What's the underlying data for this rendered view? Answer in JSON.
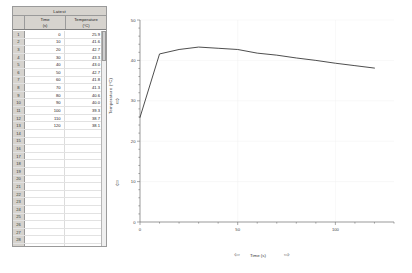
{
  "table": {
    "dataset_label": "Latest",
    "columns": [
      {
        "name": "Time",
        "unit": "(s)"
      },
      {
        "name": "Temperature",
        "unit": "(°C)"
      }
    ],
    "rows": [
      {
        "n": "1",
        "time": "0",
        "temp": "25.9"
      },
      {
        "n": "2",
        "time": "10",
        "temp": "41.6"
      },
      {
        "n": "3",
        "time": "20",
        "temp": "42.7"
      },
      {
        "n": "4",
        "time": "30",
        "temp": "43.3"
      },
      {
        "n": "5",
        "time": "40",
        "temp": "43.0"
      },
      {
        "n": "6",
        "time": "50",
        "temp": "42.7"
      },
      {
        "n": "7",
        "time": "60",
        "temp": "41.8"
      },
      {
        "n": "8",
        "time": "70",
        "temp": "41.3"
      },
      {
        "n": "9",
        "time": "80",
        "temp": "40.6"
      },
      {
        "n": "10",
        "time": "90",
        "temp": "40.0"
      },
      {
        "n": "11",
        "time": "100",
        "temp": "39.3"
      },
      {
        "n": "12",
        "time": "110",
        "temp": "38.7"
      },
      {
        "n": "13",
        "time": "120",
        "temp": "38.1"
      },
      {
        "n": "14",
        "time": "",
        "temp": ""
      },
      {
        "n": "15",
        "time": "",
        "temp": ""
      },
      {
        "n": "16",
        "time": "",
        "temp": ""
      },
      {
        "n": "17",
        "time": "",
        "temp": ""
      },
      {
        "n": "18",
        "time": "",
        "temp": ""
      },
      {
        "n": "19",
        "time": "",
        "temp": ""
      },
      {
        "n": "20",
        "time": "",
        "temp": ""
      },
      {
        "n": "21",
        "time": "",
        "temp": ""
      },
      {
        "n": "22",
        "time": "",
        "temp": ""
      },
      {
        "n": "23",
        "time": "",
        "temp": ""
      },
      {
        "n": "24",
        "time": "",
        "temp": ""
      },
      {
        "n": "25",
        "time": "",
        "temp": ""
      },
      {
        "n": "26",
        "time": "",
        "temp": ""
      },
      {
        "n": "27",
        "time": "",
        "temp": ""
      },
      {
        "n": "28",
        "time": "",
        "temp": ""
      },
      {
        "n": "29",
        "time": "",
        "temp": ""
      }
    ]
  },
  "graph": {
    "ylabel": "Temperature (°C)",
    "xlabel": "Time (s)",
    "y_arrow_up": "⇧",
    "y_arrow_down": "⇩",
    "x_arrow_left": "⇦",
    "x_arrow_right": "⇨",
    "line_color": "#3a3a3a",
    "axis_color": "#6e6e6e",
    "grid_color": "#f0f0f0"
  },
  "chart_data": {
    "type": "line",
    "title": "",
    "xlabel": "Time (s)",
    "ylabel": "Temperature (°C)",
    "xlim": [
      0,
      130
    ],
    "ylim": [
      0,
      50
    ],
    "xticks": [
      0,
      50,
      100
    ],
    "yticks": [
      0,
      10,
      20,
      30,
      40,
      50
    ],
    "grid": false,
    "legend": false,
    "x": [
      0,
      10,
      20,
      30,
      40,
      50,
      60,
      70,
      80,
      90,
      100,
      110,
      120
    ],
    "series": [
      {
        "name": "Temperature",
        "values": [
          25.9,
          41.6,
          42.7,
          43.3,
          43.0,
          42.7,
          41.8,
          41.3,
          40.6,
          40.0,
          39.3,
          38.7,
          38.1
        ]
      }
    ]
  }
}
